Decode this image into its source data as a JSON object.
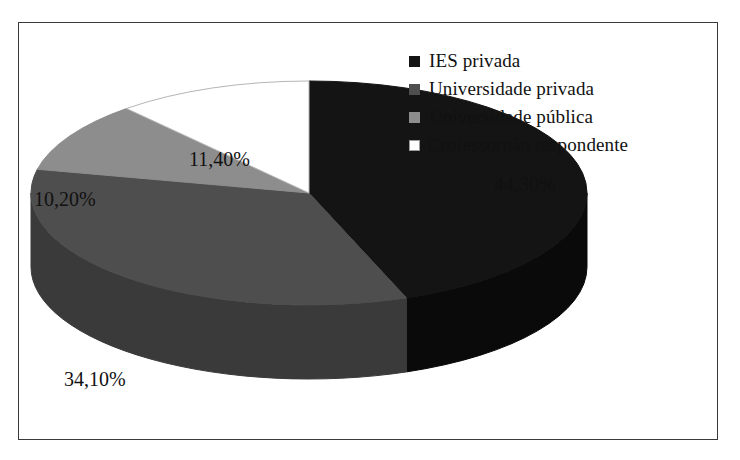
{
  "chart_data": {
    "type": "pie",
    "title": "",
    "subtitle": "",
    "xlabel": "",
    "ylabel": "",
    "legend_position": "top-right",
    "three_d": true,
    "start_angle_deg": 0,
    "direction": "clockwise",
    "categories": [
      "IES privada",
      "Universidade privada",
      "Universidade pública",
      "□rofessornão respondente"
    ],
    "values": [
      44.3,
      34.1,
      10.2,
      11.4
    ],
    "value_labels": [
      "44,30%",
      "34,10%",
      "10,20%",
      "11,40%"
    ],
    "colors": [
      "#141414",
      "#4e4e4e",
      "#8d8d8d",
      "#ffffff"
    ],
    "side_colors": [
      "#0a0a0a",
      "#3a3a3a",
      "#6f6f6f",
      "#e8e8e8"
    ],
    "slices": [
      {
        "label": "IES privada",
        "value": 44.3,
        "display": "44,30%",
        "color": "#141414"
      },
      {
        "label": "Universidade privada",
        "value": 34.1,
        "display": "34,10%",
        "color": "#4e4e4e"
      },
      {
        "label": "Universidade pública",
        "value": 10.2,
        "display": "10,20%",
        "color": "#8d8d8d"
      },
      {
        "label": "□rofessornão respondente",
        "value": 11.4,
        "display": "11,40%",
        "color": "#ffffff"
      }
    ]
  },
  "legend": {
    "items": [
      {
        "label": "IES privada",
        "swatch": "#141414",
        "name": "legend-swatch-ies-privada"
      },
      {
        "label": "Universidade privada",
        "swatch": "#4e4e4e",
        "name": "legend-swatch-universidade-privada"
      },
      {
        "label": "Universidade pública",
        "swatch": "#8d8d8d",
        "name": "legend-swatch-universidade-publica"
      },
      {
        "label": "□rofessornão respondente",
        "swatch": "#ffffff",
        "name": "legend-swatch-professor-nao-respondente"
      }
    ]
  },
  "labels": {
    "pct_0": "44,30%",
    "pct_1": "34,10%",
    "pct_2": "10,20%",
    "pct_3": "11,40%"
  },
  "frame": {
    "border_color": "#3a3a3a",
    "background": "#ffffff"
  }
}
